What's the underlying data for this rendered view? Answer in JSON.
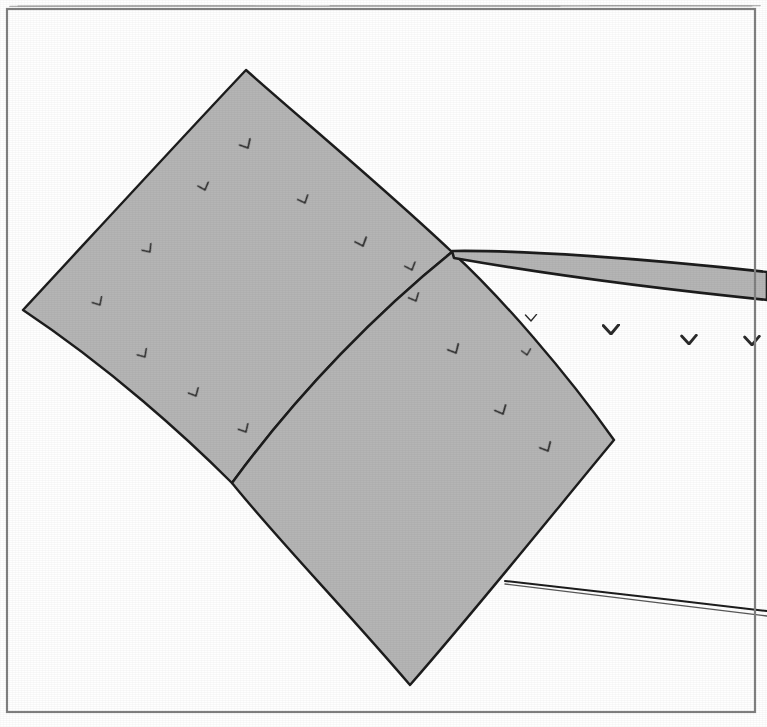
{
  "figure": {
    "domain": "scanned-line-art-diagram",
    "title": "Scanned figure plate",
    "background_color": "#ffffff",
    "frame": {
      "name": "plate-border",
      "x": 7,
      "y": 9,
      "width": 748,
      "height": 703,
      "stroke_color": "#8a8a8a",
      "stroke_width": 2.2
    },
    "top_cut_line": {
      "name": "page-edge-artifact",
      "y": 6,
      "x1": 10,
      "x2": 760,
      "color": "#b0b0b0"
    },
    "fill_color": "#b5b5b5",
    "outline_color": "#1c1c1c",
    "glyph_color": "#2a2a2a",
    "panels": [
      {
        "name": "upper-left-panel",
        "label": "panel-A",
        "fill": "#b5b5b5",
        "vertices_hint": [
          [
            246,
            70
          ],
          [
            452,
            252
          ],
          [
            232,
            483
          ],
          [
            23,
            310
          ]
        ]
      },
      {
        "name": "lower-right-panel",
        "label": "panel-B",
        "fill": "#b5b5b5",
        "vertices_hint": [
          [
            452,
            252
          ],
          [
            614,
            440
          ],
          [
            410,
            685
          ],
          [
            232,
            483
          ]
        ]
      },
      {
        "name": "upper-right-band",
        "label": "band-C",
        "fill": "#b5b5b5",
        "vertices_hint": [
          [
            452,
            252
          ],
          [
            767,
            272
          ],
          [
            767,
            300
          ],
          [
            452,
            256
          ]
        ]
      },
      {
        "name": "lower-right-thin-curve",
        "label": "curve-D",
        "fill": "none",
        "vertices_hint": [
          [
            505,
            582
          ],
          [
            767,
            612
          ]
        ]
      }
    ],
    "tick_glyphs": {
      "name": "bird-tick-marks",
      "symbol": "v",
      "description": "small hand-drawn v / bird-shaped tick marks",
      "on_gray": [
        {
          "x": 248,
          "y": 148,
          "rot": -28,
          "size": 13,
          "w": 1.7
        },
        {
          "x": 205,
          "y": 190,
          "rot": -18,
          "size": 12,
          "w": 1.6
        },
        {
          "x": 305,
          "y": 203,
          "rot": -22,
          "size": 12,
          "w": 1.6
        },
        {
          "x": 150,
          "y": 252,
          "rot": -35,
          "size": 12,
          "w": 1.5
        },
        {
          "x": 363,
          "y": 246,
          "rot": -20,
          "size": 13,
          "w": 1.8
        },
        {
          "x": 100,
          "y": 305,
          "rot": -30,
          "size": 12,
          "w": 1.5
        },
        {
          "x": 412,
          "y": 270,
          "rot": -20,
          "size": 12,
          "w": 1.6
        },
        {
          "x": 416,
          "y": 301,
          "rot": -24,
          "size": 12,
          "w": 1.6
        },
        {
          "x": 145,
          "y": 357,
          "rot": -32,
          "size": 12,
          "w": 1.5
        },
        {
          "x": 196,
          "y": 396,
          "rot": -26,
          "size": 12,
          "w": 1.6
        },
        {
          "x": 246,
          "y": 432,
          "rot": -28,
          "size": 12,
          "w": 1.6
        },
        {
          "x": 456,
          "y": 353,
          "rot": -26,
          "size": 13,
          "w": 1.7
        },
        {
          "x": 503,
          "y": 414,
          "rot": -24,
          "size": 13,
          "w": 1.7
        },
        {
          "x": 548,
          "y": 451,
          "rot": -26,
          "size": 13,
          "w": 1.7
        }
      ],
      "on_white": [
        {
          "x": 531,
          "y": 321,
          "rot": 0,
          "size": 12,
          "w": 1.4
        },
        {
          "x": 527,
          "y": 355,
          "rot": -10,
          "size": 10,
          "w": 1.3
        },
        {
          "x": 611,
          "y": 334,
          "rot": 0,
          "size": 17,
          "w": 3.0
        },
        {
          "x": 689,
          "y": 344,
          "rot": 0,
          "size": 16,
          "w": 2.8
        },
        {
          "x": 752,
          "y": 345,
          "rot": 0,
          "size": 16,
          "w": 2.8
        }
      ]
    }
  }
}
